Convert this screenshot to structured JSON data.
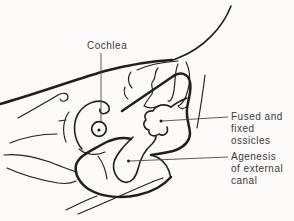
{
  "figure": {
    "labels": {
      "cochlea": "Cochlea",
      "fused_ossicles": {
        "lines": [
          "Fused and",
          "fixed",
          "ossicles"
        ]
      },
      "agenesis_canal": {
        "lines": [
          "Agenesis",
          "of external",
          "canal"
        ]
      }
    },
    "colors": {
      "ink": "#1f1f1f",
      "text": "#3a3a3a",
      "leader": "#4a4a4a",
      "background": "#fbfaf8"
    }
  }
}
